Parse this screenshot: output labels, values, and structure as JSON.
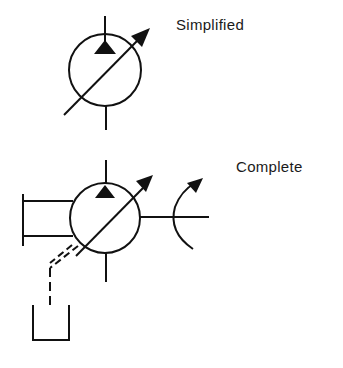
{
  "labels": {
    "simplified": "Simplified",
    "complete": "Complete"
  },
  "symbols": [
    {
      "name": "variable-displacement-pump-simplified",
      "caption": "Simplified"
    },
    {
      "name": "variable-displacement-pump-complete",
      "caption": "Complete",
      "parts": [
        "pump",
        "variable-adjustment-arrow",
        "drive-shaft-rotation",
        "case-drain-to-tank",
        "pressure-compensator-box"
      ]
    }
  ],
  "colors": {
    "stroke": "#111111",
    "background": "#ffffff"
  }
}
